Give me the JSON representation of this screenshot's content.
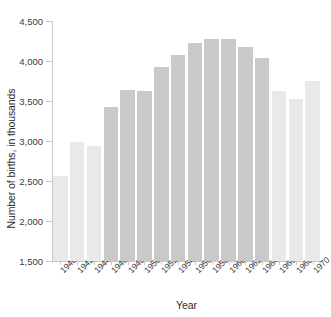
{
  "chart_data": {
    "type": "bar",
    "title": "",
    "xlabel": "Year",
    "ylabel": "Number of births, in thousands",
    "categories": [
      "1940",
      "1942",
      "1944",
      "1946",
      "1948",
      "1950",
      "1952",
      "1954",
      "1956",
      "1958",
      "1960",
      "1962",
      "1964",
      "1966",
      "1968",
      "1970"
    ],
    "values": [
      2560,
      2990,
      2940,
      3420,
      3640,
      3630,
      3920,
      4080,
      4230,
      4270,
      4270,
      4180,
      4040,
      3620,
      3520,
      3750
    ],
    "bar_colors": [
      "#e9e9e9",
      "#e9e9e9",
      "#e9e9e9",
      "#c9c9c9",
      "#c9c9c9",
      "#c9c9c9",
      "#c9c9c9",
      "#c9c9c9",
      "#c9c9c9",
      "#c9c9c9",
      "#c9c9c9",
      "#c9c9c9",
      "#c9c9c9",
      "#e9e9e9",
      "#e9e9e9",
      "#e9e9e9"
    ],
    "ylim": [
      1500,
      4500
    ],
    "ytick_labels": [
      "4,500",
      "4,000",
      "3,500",
      "3,000",
      "2,500",
      "2,000",
      "1,500"
    ],
    "ytick_values": [
      4500,
      4000,
      3500,
      3000,
      2500,
      2000,
      1500
    ],
    "grid": false,
    "legend": null,
    "axis_color": "#c9c9c9",
    "text_color": "#2b2b2b",
    "background": "#ffffff"
  }
}
